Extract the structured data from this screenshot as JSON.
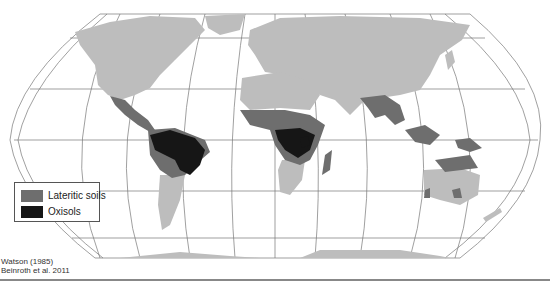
{
  "map": {
    "projection": "Robinson-like world projection with graticule",
    "colors": {
      "background": "#ffffff",
      "land": "#bdbdbd",
      "lateritic_soils": "#6e6e6e",
      "oxisols": "#161616",
      "graticule": "#666666"
    }
  },
  "legend": {
    "items": [
      {
        "label": "Lateritic soils",
        "color": "#6e6e6e"
      },
      {
        "label": "Oxisols",
        "color": "#161616"
      }
    ]
  },
  "credits": {
    "line1": "Watson (1985)",
    "line2": "Beinroth et al. 2011"
  }
}
